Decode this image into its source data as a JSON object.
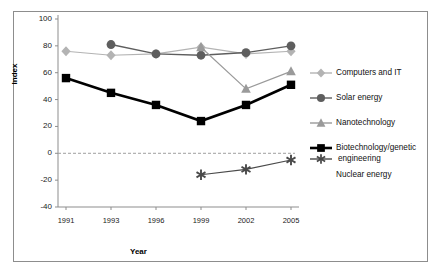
{
  "chart_data": {
    "type": "line",
    "title": "",
    "xlabel": "Year",
    "ylabel": "Index",
    "categories": [
      "1991",
      "1993",
      "1996",
      "1999",
      "2002",
      "2005"
    ],
    "x": [
      1991,
      1993,
      1996,
      1999,
      2002,
      2005
    ],
    "ylim": [
      -40,
      100
    ],
    "yticks": [
      -40,
      -20,
      0,
      20,
      40,
      60,
      80,
      100
    ],
    "ytick_labels": [
      "-40",
      "-20",
      "0",
      "20",
      "40",
      "60",
      "80",
      "100"
    ],
    "grid": false,
    "zero_line": true,
    "legend_position": "right",
    "series": [
      {
        "name": "Computers and IT",
        "marker": "diamond",
        "color": "#b3b3b3",
        "values": [
          76,
          73,
          74,
          79,
          74,
          76
        ],
        "points": [
          {
            "x": "1991",
            "y": 76
          },
          {
            "x": "1993",
            "y": 73
          },
          {
            "x": "1996",
            "y": 74
          },
          {
            "x": "1999",
            "y": 79
          },
          {
            "x": "2002",
            "y": 74
          },
          {
            "x": "2005",
            "y": 76
          }
        ]
      },
      {
        "name": "Solar energy",
        "marker": "circle",
        "color": "#5e5e5e",
        "values": [
          null,
          81,
          74,
          73,
          75,
          80
        ],
        "points": [
          {
            "x": "1993",
            "y": 81
          },
          {
            "x": "1996",
            "y": 74
          },
          {
            "x": "1999",
            "y": 73
          },
          {
            "x": "2002",
            "y": 75
          },
          {
            "x": "2005",
            "y": 80
          }
        ]
      },
      {
        "name": "Nanotechnology",
        "marker": "triangle",
        "color": "#9a9a9a",
        "values": [
          null,
          null,
          null,
          79,
          48,
          61
        ],
        "points": [
          {
            "x": "1999",
            "y": 79
          },
          {
            "x": "2002",
            "y": 48
          },
          {
            "x": "2005",
            "y": 61
          }
        ]
      },
      {
        "name": "Biotechnology/genetic engineering",
        "marker": "square",
        "color": "#000000",
        "values": [
          56,
          45,
          36,
          24,
          36,
          51
        ],
        "points": [
          {
            "x": "1991",
            "y": 56
          },
          {
            "x": "1993",
            "y": 45
          },
          {
            "x": "1996",
            "y": 36
          },
          {
            "x": "1999",
            "y": 24
          },
          {
            "x": "2002",
            "y": 36
          },
          {
            "x": "2005",
            "y": 51
          }
        ]
      },
      {
        "name": "Nuclear energy",
        "marker": "asterisk",
        "color": "#4a4a4a",
        "values": [
          null,
          null,
          null,
          -16,
          -12,
          -5
        ],
        "points": [
          {
            "x": "1999",
            "y": -16
          },
          {
            "x": "2002",
            "y": -12
          },
          {
            "x": "2005",
            "y": -5
          }
        ]
      }
    ]
  },
  "legend": {
    "items": [
      {
        "label": "Computers and IT"
      },
      {
        "label": "Solar energy"
      },
      {
        "label": "Nanotechnology"
      },
      {
        "label": "Biotechnology/genetic"
      },
      {
        "label": "engineering"
      },
      {
        "label": "Nuclear energy"
      }
    ]
  },
  "axes": {
    "y_title": "Index",
    "x_title": "Year",
    "y_ticks": [
      "100",
      "80",
      "60",
      "40",
      "20",
      "0",
      "-20",
      "-40"
    ],
    "x_ticks": [
      "1991",
      "1993",
      "1996",
      "1999",
      "2002",
      "2005"
    ]
  }
}
